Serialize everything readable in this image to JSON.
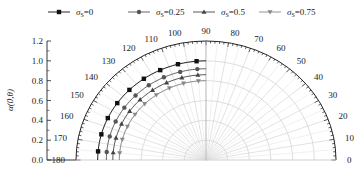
{
  "chart_data": {
    "type": "polar-line",
    "title": "",
    "ylabel": "α(0,θ)",
    "radial_axis": {
      "range": [
        0,
        1.2
      ],
      "ticks": [
        "0.0",
        "0.2",
        "0.4",
        "0.6",
        "0.8",
        "1.0",
        "1.2"
      ],
      "grid_circles": [
        0.2,
        0.4,
        0.6,
        0.8,
        1.0
      ]
    },
    "angular_axis": {
      "range_deg": [
        0,
        180
      ],
      "tick_labels": [
        "0",
        "10",
        "20",
        "30",
        "40",
        "50",
        "60",
        "70",
        "80",
        "90",
        "100",
        "110",
        "120",
        "130",
        "140",
        "150",
        "160",
        "170",
        "180"
      ],
      "grid_step_deg": 10
    },
    "theta_deg": [
      90,
      95,
      105,
      115,
      125,
      135,
      145,
      155,
      165,
      175,
      180
    ],
    "series": [
      {
        "name": "σs=0",
        "legend_sub": "S",
        "legend_value": "0",
        "marker": "square",
        "color": "#111111",
        "values": [
          1.0,
          1.0,
          1.0,
          1.0,
          1.0,
          1.0,
          1.0,
          1.0,
          1.0,
          1.0,
          1.0
        ]
      },
      {
        "name": "σs=0.25",
        "legend_sub": "S",
        "legend_value": "0.25",
        "marker": "circle",
        "color": "#555555",
        "values": [
          0.92,
          0.92,
          0.92,
          0.92,
          0.92,
          0.92,
          0.92,
          0.92,
          0.92,
          0.92,
          0.92
        ]
      },
      {
        "name": "σs=0.5",
        "legend_sub": "S",
        "legend_value": "0.5",
        "marker": "triangle",
        "color": "#444444",
        "values": [
          0.86,
          0.86,
          0.86,
          0.86,
          0.86,
          0.86,
          0.86,
          0.86,
          0.86,
          0.86,
          0.86
        ]
      },
      {
        "name": "σs=0.75",
        "legend_sub": "S",
        "legend_value": "0.75",
        "marker": "tri-down",
        "color": "#888888",
        "values": [
          0.8,
          0.8,
          0.8,
          0.8,
          0.8,
          0.8,
          0.8,
          0.8,
          0.8,
          0.8,
          0.8
        ]
      }
    ],
    "legend_position": "top",
    "grid": true
  },
  "legend": [
    {
      "symbol": "σ",
      "sub": "S",
      "value": "=0"
    },
    {
      "symbol": "σ",
      "sub": "S",
      "value": "=0.25"
    },
    {
      "symbol": "σ",
      "sub": "S",
      "value": "=0.5"
    },
    {
      "symbol": "σ",
      "sub": "S",
      "value": "=0.75"
    }
  ]
}
